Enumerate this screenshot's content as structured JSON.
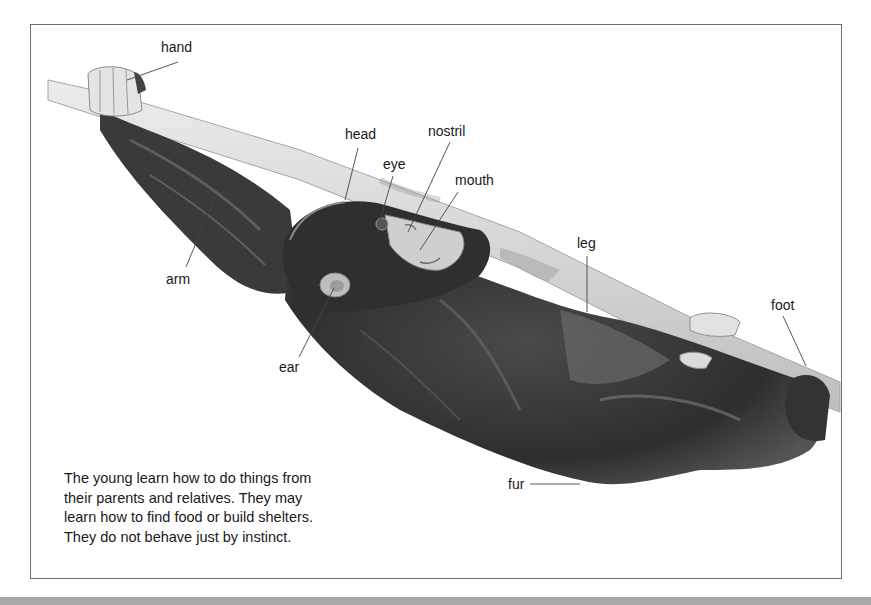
{
  "figure": {
    "labels": [
      {
        "id": "hand",
        "text": "hand"
      },
      {
        "id": "head",
        "text": "head"
      },
      {
        "id": "eye",
        "text": "eye"
      },
      {
        "id": "nostril",
        "text": "nostril"
      },
      {
        "id": "mouth",
        "text": "mouth"
      },
      {
        "id": "arm",
        "text": "arm"
      },
      {
        "id": "leg",
        "text": "leg"
      },
      {
        "id": "foot",
        "text": "foot"
      },
      {
        "id": "ear",
        "text": "ear"
      },
      {
        "id": "fur",
        "text": "fur"
      }
    ],
    "caption": [
      "The young learn how to do things from",
      "their parents and relatives. They may",
      "learn how to find food or build shelters.",
      "They do not behave just by instinct."
    ]
  },
  "colors": {
    "border": "#6e6e6e",
    "fur_dark": "#2b2b2b",
    "fur_mid": "#5a5a5a",
    "branch": "#d9d9d9",
    "skin": "#cfcfcf",
    "bottom_bar": "#a8a8a8"
  }
}
